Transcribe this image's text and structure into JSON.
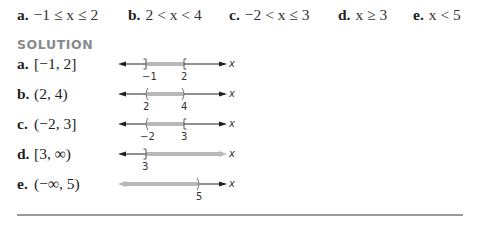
{
  "problems": [
    {
      "label": "a.",
      "expr": "−1 ≤ x ≤ 2",
      "left": 17
    },
    {
      "label": "b.",
      "expr": "2 < x < 4",
      "left": 128
    },
    {
      "label": "c.",
      "expr": "−2 < x ≤ 3",
      "left": 229
    },
    {
      "label": "d.",
      "expr": "x ≥ 3",
      "left": 338
    },
    {
      "label": "e.",
      "expr": "x < 5",
      "left": 413
    }
  ],
  "solution": {
    "heading": "SOLUTION",
    "rows": [
      {
        "label": "a.",
        "answer": "[−1, 2]",
        "ticks": [
          "−1",
          "2"
        ],
        "variable": "x"
      },
      {
        "label": "b.",
        "answer": "(2, 4)",
        "ticks": [
          "2",
          "4"
        ],
        "variable": "x"
      },
      {
        "label": "c.",
        "answer": "(−2, 3]",
        "ticks": [
          "−2",
          "3"
        ],
        "variable": "x"
      },
      {
        "label": "d.",
        "answer": "[3, ∞)",
        "ticks": [
          "3"
        ],
        "variable": "x"
      },
      {
        "label": "e.",
        "answer": "(−∞, 5)",
        "ticks": [
          "5"
        ],
        "variable": "x"
      }
    ]
  },
  "colors": {
    "text": "#231f20",
    "heading": "#8a8a8a",
    "shade": "#b8b8b8",
    "axis": "#231f20",
    "rule": "#9a9a9a"
  }
}
